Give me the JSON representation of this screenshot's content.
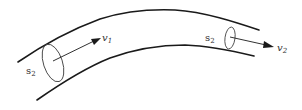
{
  "diagram": {
    "colors": {
      "wall": "#1a1a1a",
      "section": "#4a4a4a",
      "arrow": "#1a1a1a",
      "label": "#333333",
      "background": "#ffffff"
    },
    "left_section": {
      "area_label": "s",
      "area_subscript": "2",
      "velocity_label": "v",
      "velocity_subscript": "1"
    },
    "right_section": {
      "area_label": "s",
      "area_subscript": "2",
      "velocity_label": "v",
      "velocity_subscript": "2"
    }
  }
}
